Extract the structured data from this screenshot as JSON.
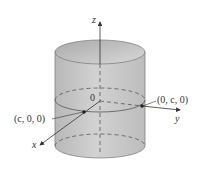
{
  "diagram": {
    "type": "cylinder-3d-axes",
    "axes": {
      "z": "z",
      "y": "y",
      "x": "x"
    },
    "origin_label": "0",
    "points": [
      {
        "label": "(c, 0, 0)"
      },
      {
        "label": "(0, c, 0)"
      }
    ],
    "colors": {
      "cylinder_fill": "#c4c4c4",
      "cylinder_top": "#d6d6d6",
      "line": "#555555"
    }
  }
}
